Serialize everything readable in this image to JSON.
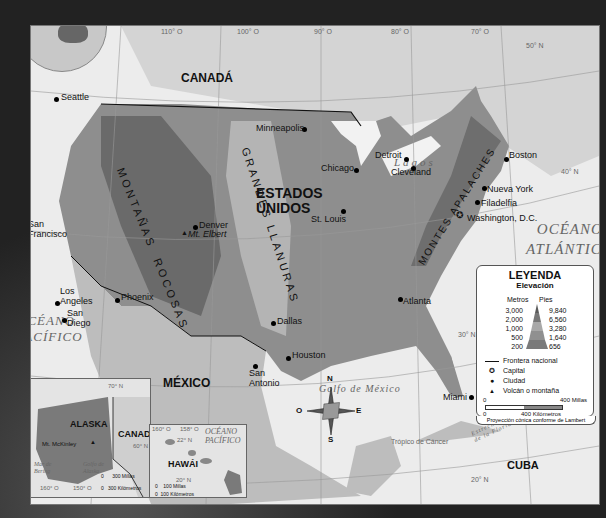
{
  "map": {
    "countries": {
      "canada": "CANADÁ",
      "usa_line1": "ESTADOS",
      "usa_line2": "UNIDOS",
      "mexico": "MÉXICO",
      "cuba": "CUBA"
    },
    "oceans": {
      "pacific_line1": "OCÉANO",
      "pacific_line2": "PACÍFICO",
      "atlantic_line1": "OCÉANO",
      "atlantic_line2": "ATLÁNTICO",
      "gulf": "Golfo de México",
      "lakes": "Lagos",
      "straits_line1": "Estrecho",
      "straits_line2": "de la Florida",
      "tropic": "Trópico de Cáncer"
    },
    "ranges": {
      "rockies_line1": "MONTAÑAS",
      "rockies_line2": "ROCOSAS",
      "plains_line1": "GRANDES",
      "plains_line2": "LLANURAS",
      "appalachians": "MONTES APALACHES"
    },
    "cities": [
      {
        "name": "Seattle"
      },
      {
        "name": "San Francisco"
      },
      {
        "name": "Los Angeles"
      },
      {
        "name": "San Diego"
      },
      {
        "name": "Phoenix"
      },
      {
        "name": "Denver"
      },
      {
        "name": "Dallas"
      },
      {
        "name": "San Antonio"
      },
      {
        "name": "Houston"
      },
      {
        "name": "Minneapolis"
      },
      {
        "name": "Chicago"
      },
      {
        "name": "St. Louis"
      },
      {
        "name": "Detroit"
      },
      {
        "name": "Cleveland"
      },
      {
        "name": "Atlanta"
      },
      {
        "name": "Boston"
      },
      {
        "name": "Nueva York"
      },
      {
        "name": "Filadelfia"
      },
      {
        "name": "Washington, D.C."
      },
      {
        "name": "Miami"
      }
    ],
    "mountains": {
      "elbert": "Mt. Elbert",
      "mckinley": "Mt. McKinley"
    },
    "gridlines": {
      "lon120": "120° O",
      "lon110": "110° O",
      "lon100": "100° O",
      "lon90": "90° O",
      "lon80": "80° O",
      "lon70": "70° O",
      "lat50": "50° N",
      "lat40": "40° N",
      "lat30": "30° N",
      "lat20": "20° N"
    },
    "compass": {
      "n": "N",
      "s": "S",
      "e": "E",
      "o": "O"
    }
  },
  "insets": {
    "alaska": {
      "title": "ALASKA",
      "neighbor": "CANADÁ",
      "sea_line1": "Mar de",
      "sea_line2": "Bering",
      "gulf_line1": "Golfo de",
      "gulf_line2": "Alaska",
      "lat70": "70° N",
      "lat60": "60° N",
      "lon160": "160° O",
      "lon150": "150° O",
      "scale_zero": "0",
      "scale_miles": "300 Millas",
      "scale_km": "300 Kilómetros"
    },
    "hawaii": {
      "title": "HAWÁI",
      "ocean_line1": "OCÉANO",
      "ocean_line2": "PACÍFICO",
      "lon160": "160° O",
      "lon158": "158° O",
      "lat22": "22° N",
      "lat20": "20° N",
      "scale_zero": "0",
      "scale_miles": "100 Millas",
      "scale_km": "100 Kilómetros"
    }
  },
  "legend": {
    "title": "LEYENDA",
    "subtitle": "Elevación",
    "col_meters": "Metros",
    "col_feet": "Pies",
    "levels": [
      {
        "m": "3,000",
        "ft": "9,840",
        "color": "#5a5a5a"
      },
      {
        "m": "2,000",
        "ft": "6,560",
        "color": "#777777"
      },
      {
        "m": "1,000",
        "ft": "3,280",
        "color": "#a8a8a8"
      },
      {
        "m": "500",
        "ft": "1,640",
        "color": "#909090"
      },
      {
        "m": "200",
        "ft": "656",
        "color": "#7a7a7a"
      }
    ],
    "items": [
      {
        "symbol": "line-icon",
        "label": "Frontera nacional"
      },
      {
        "symbol": "star-icon",
        "label": "Capital"
      },
      {
        "symbol": "dot-icon",
        "label": "Ciudad"
      },
      {
        "symbol": "triangle-icon",
        "label": "Volcán o montaña"
      }
    ],
    "scale_zero": "0",
    "scale_miles": "400 Millas",
    "scale_km": "400 Kilómetros",
    "projection": "Proyección cónica conforme de Lambert"
  }
}
